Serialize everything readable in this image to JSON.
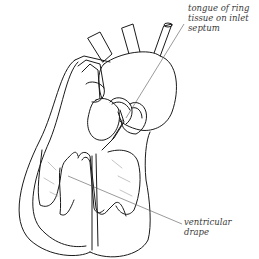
{
  "diagram": {
    "style": "black line drawing on white",
    "colors": {
      "line": "#1a1a1a",
      "leader_line": "#555555",
      "text": "#3a3a3a",
      "background": "#ffffff"
    },
    "labels": [
      {
        "id": "tongue",
        "lines": [
          "tongue of ring",
          "tissue on inlet",
          "septum"
        ]
      },
      {
        "id": "drape",
        "lines": [
          "ventricular",
          "drape"
        ]
      }
    ]
  }
}
